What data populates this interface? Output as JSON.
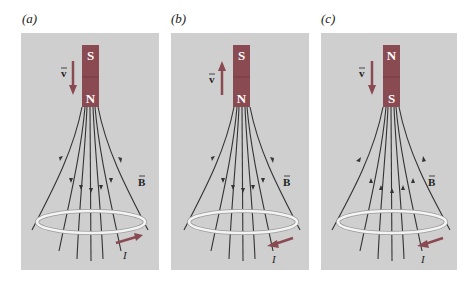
{
  "figure": {
    "panels": [
      {
        "label": "(a)",
        "magnet": {
          "top_pole": "S",
          "bottom_pole": "N"
        },
        "velocity": {
          "label": "v",
          "direction": "down"
        },
        "field": {
          "label": "B",
          "direction": "down"
        },
        "current": {
          "label": "I",
          "direction": "counterclockwise-viewed-from-above"
        }
      },
      {
        "label": "(b)",
        "magnet": {
          "top_pole": "S",
          "bottom_pole": "N"
        },
        "velocity": {
          "label": "v",
          "direction": "up"
        },
        "field": {
          "label": "B",
          "direction": "down"
        },
        "current": {
          "label": "I",
          "direction": "clockwise-viewed-from-above"
        }
      },
      {
        "label": "(c)",
        "magnet": {
          "top_pole": "N",
          "bottom_pole": "S"
        },
        "velocity": {
          "label": "v",
          "direction": "down"
        },
        "field": {
          "label": "B",
          "direction": "up"
        },
        "current": {
          "label": "I",
          "direction": "clockwise-viewed-from-above"
        }
      }
    ],
    "colors": {
      "panel_bg": "#cfcfcf",
      "magnet": "#8a4a52",
      "arrow": "#8a4a52",
      "field_line": "#333333",
      "loop": "#f4f4f4"
    }
  }
}
